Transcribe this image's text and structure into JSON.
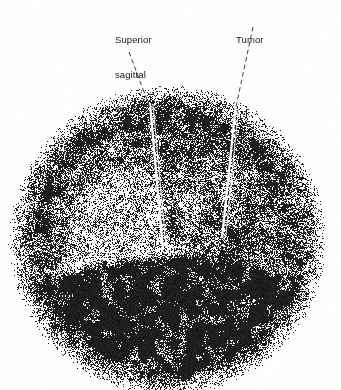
{
  "figure": {
    "kind": "radionuclide-brain-scan",
    "width": 341,
    "height": 390,
    "background_color": "#fcfcfc",
    "ink_color": "#111111",
    "label_color": "#16161a",
    "leader_color": "#3c3c3c"
  },
  "annotations": [
    {
      "id": "superior-sagittal-sinus",
      "lines": [
        "Superior",
        "sagittal",
        "sinus"
      ],
      "text": "Superior sagittal sinus",
      "label_x": 115,
      "label_y": 11,
      "leader": {
        "x1": 129,
        "y1": 52,
        "x2": 150,
        "y2": 108
      }
    },
    {
      "id": "tumor",
      "lines": [
        "Tumor"
      ],
      "text": "Tumor",
      "label_x": 236,
      "label_y": 11,
      "leader": {
        "x1": 253,
        "y1": 27,
        "x2": 236,
        "y2": 107
      }
    }
  ],
  "scan_data": {
    "type": "dot-density-scintigram",
    "view": "anterior",
    "head_outline": {
      "center_x": 167,
      "center_y": 240,
      "radius_x": 145,
      "radius_y": 142,
      "top_y": 98,
      "bottom_y": 379,
      "left_x": 22,
      "right_x": 312
    },
    "seed": 20240517,
    "total_dots": 52000,
    "regions": [
      {
        "name": "peripheral-scalp-rim",
        "note": "dense dark annulus of tracer uptake around the cranial vault",
        "intensity": 0.92,
        "inner_fraction": 0.62,
        "outer_fraction": 1.0
      },
      {
        "name": "basal-crescent",
        "note": "solid black crescent at skull base / neck region",
        "intensity": 1.0,
        "center_x": 167,
        "center_y": 318,
        "radius_x": 150,
        "radius_y": 66
      },
      {
        "name": "cerebral-hemispheres",
        "note": "relatively photopenic interior brain parenchyma",
        "intensity": 0.33
      },
      {
        "name": "left-photopenic-zone",
        "note": "bright low-uptake area, left lower quadrant of image",
        "intensity": 0.16,
        "center_x": 120,
        "center_y": 285,
        "radius_x": 54,
        "radius_y": 38
      },
      {
        "name": "tumor-focus",
        "note": "focal hot spot of increased tracer uptake, right of midline",
        "intensity": 0.86,
        "center_x": 232,
        "center_y": 235,
        "radius_x": 38,
        "radius_y": 44
      },
      {
        "name": "superior-sagittal-sinus",
        "note": "vertical midline venous sinus, seen as linear uptake",
        "intensity": 0.7,
        "x": 160,
        "y_top": 108,
        "y_bottom": 250,
        "width": 14
      },
      {
        "name": "upper-midline-shadow",
        "note": "darker band across superior midline convexity",
        "intensity": 0.78,
        "center_x": 175,
        "center_y": 150,
        "radius_x": 62,
        "radius_y": 30
      }
    ]
  }
}
